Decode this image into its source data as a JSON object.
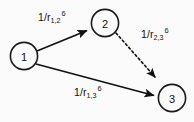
{
  "diagram": {
    "type": "directed-graph",
    "background_color": "#fbfbfb",
    "stroke_color": "#111111",
    "nodes": [
      {
        "id": "1",
        "label": "1",
        "cx": 24,
        "cy": 56,
        "r": 14
      },
      {
        "id": "2",
        "label": "2",
        "cx": 105,
        "cy": 23,
        "r": 14
      },
      {
        "id": "3",
        "label": "3",
        "cx": 172,
        "cy": 98,
        "r": 14
      }
    ],
    "edges": [
      {
        "id": "edge-1-2",
        "from": "1",
        "to": "2",
        "style": "solid",
        "arrow": true,
        "x1": 37,
        "y1": 51,
        "x2": 89,
        "y2": 30,
        "label_text": "1/r",
        "label_sub": "1,2",
        "label_sup": "6"
      },
      {
        "id": "edge-2-3",
        "from": "2",
        "to": "3",
        "style": "dashed",
        "arrow": true,
        "x1": 116,
        "y1": 33,
        "x2": 158,
        "y2": 80,
        "label_text": "1/r",
        "label_sub": "2,3",
        "label_sup": "6"
      },
      {
        "id": "edge-1-3",
        "from": "1",
        "to": "3",
        "style": "solid",
        "arrow": true,
        "x1": 36,
        "y1": 64,
        "x2": 156,
        "y2": 96,
        "label_text": "1/r",
        "label_sub": "1,3",
        "label_sup": "6"
      }
    ]
  }
}
